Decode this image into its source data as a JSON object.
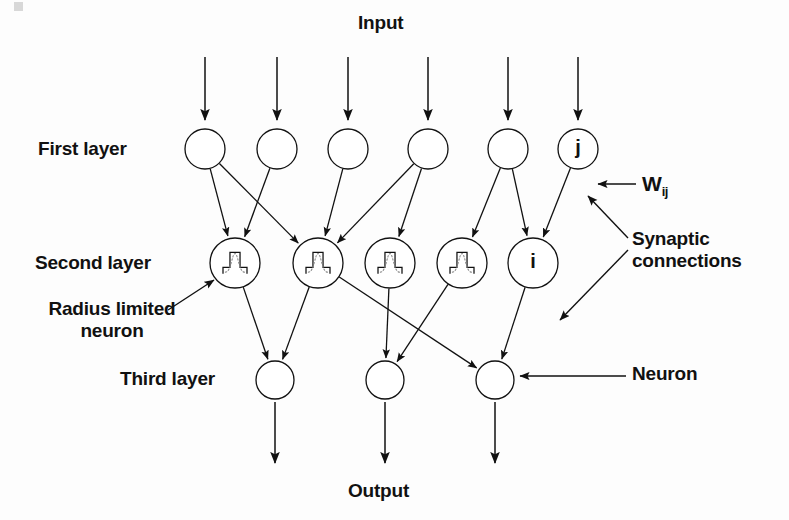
{
  "diagram": {
    "title_top": "Input",
    "title_bottom": "Output",
    "background_color": "#fdfdfd",
    "stroke_color": "#111111",
    "labels": {
      "input": "Input",
      "output": "Output",
      "first_layer": "First layer",
      "second_layer": "Second layer",
      "third_layer": "Third layer",
      "radius_limited_neuron": "Radius limited neuron",
      "synaptic_connections": "Synaptic connections",
      "neuron": "Neuron",
      "weight_symbol": "W",
      "weight_subscript": "ij"
    },
    "layers": [
      {
        "name": "first-layer",
        "label": "First layer",
        "y": 149,
        "radius": 20,
        "nodes": [
          {
            "id": "L1N1",
            "x": 205,
            "glyph": ""
          },
          {
            "id": "L1N2",
            "x": 277,
            "glyph": ""
          },
          {
            "id": "L1N3",
            "x": 348,
            "glyph": ""
          },
          {
            "id": "L1N4",
            "x": 428,
            "glyph": ""
          },
          {
            "id": "L1N5",
            "x": 508,
            "glyph": ""
          },
          {
            "id": "L1N6",
            "x": 578,
            "glyph": "j"
          }
        ]
      },
      {
        "name": "second-layer",
        "label": "Second layer",
        "y": 263,
        "radius": 25,
        "nodes": [
          {
            "id": "L2N1",
            "x": 235,
            "glyph": "",
            "waveform": true
          },
          {
            "id": "L2N2",
            "x": 318,
            "glyph": "",
            "waveform": true
          },
          {
            "id": "L2N3",
            "x": 390,
            "glyph": "",
            "waveform": true
          },
          {
            "id": "L2N4",
            "x": 462,
            "glyph": "",
            "waveform": true
          },
          {
            "id": "L2N5",
            "x": 533,
            "glyph": "i",
            "waveform": false
          }
        ]
      },
      {
        "name": "third-layer",
        "label": "Third layer",
        "y": 380,
        "radius": 19,
        "nodes": [
          {
            "id": "L3N1",
            "x": 275,
            "glyph": ""
          },
          {
            "id": "L3N2",
            "x": 385,
            "glyph": ""
          },
          {
            "id": "L3N3",
            "x": 495,
            "glyph": ""
          }
        ]
      }
    ],
    "input_arrows": [
      {
        "x": 205,
        "y1": 57,
        "y2": 120
      },
      {
        "x": 277,
        "y1": 57,
        "y2": 120
      },
      {
        "x": 348,
        "y1": 57,
        "y2": 120
      },
      {
        "x": 428,
        "y1": 57,
        "y2": 120
      },
      {
        "x": 508,
        "y1": 57,
        "y2": 120
      },
      {
        "x": 578,
        "y1": 57,
        "y2": 120
      }
    ],
    "output_arrows": [
      {
        "x": 275,
        "y1": 402,
        "y2": 463
      },
      {
        "x": 385,
        "y1": 402,
        "y2": 463
      },
      {
        "x": 495,
        "y1": 402,
        "y2": 463
      }
    ],
    "connections_layer1_to_2": [
      {
        "from": "L1N1",
        "to": "L2N1"
      },
      {
        "from": "L1N1",
        "to": "L2N2"
      },
      {
        "from": "L1N2",
        "to": "L2N1"
      },
      {
        "from": "L1N3",
        "to": "L2N2"
      },
      {
        "from": "L1N4",
        "to": "L2N2"
      },
      {
        "from": "L1N4",
        "to": "L2N3"
      },
      {
        "from": "L1N5",
        "to": "L2N4"
      },
      {
        "from": "L1N5",
        "to": "L2N5"
      },
      {
        "from": "L1N6",
        "to": "L2N5"
      }
    ],
    "connections_layer2_to_3": [
      {
        "from": "L2N1",
        "to": "L3N1"
      },
      {
        "from": "L2N2",
        "to": "L3N1"
      },
      {
        "from": "L2N2",
        "to": "L3N3"
      },
      {
        "from": "L2N3",
        "to": "L3N2"
      },
      {
        "from": "L2N4",
        "to": "L3N2"
      },
      {
        "from": "L2N5",
        "to": "L3N3"
      }
    ],
    "annotation_arrows": [
      {
        "name": "wij-pointer",
        "x1": 636,
        "y1": 184,
        "x2": 598,
        "y2": 184
      },
      {
        "name": "synaptic-pointer-1",
        "x1": 628,
        "y1": 238,
        "x2": 588,
        "y2": 196
      },
      {
        "name": "synaptic-pointer-2",
        "x1": 628,
        "y1": 250,
        "x2": 560,
        "y2": 320
      },
      {
        "name": "neuron-pointer",
        "x1": 626,
        "y1": 376,
        "x2": 520,
        "y2": 376
      },
      {
        "name": "radius-pointer",
        "x1": 168,
        "y1": 310,
        "x2": 214,
        "y2": 280
      }
    ]
  }
}
